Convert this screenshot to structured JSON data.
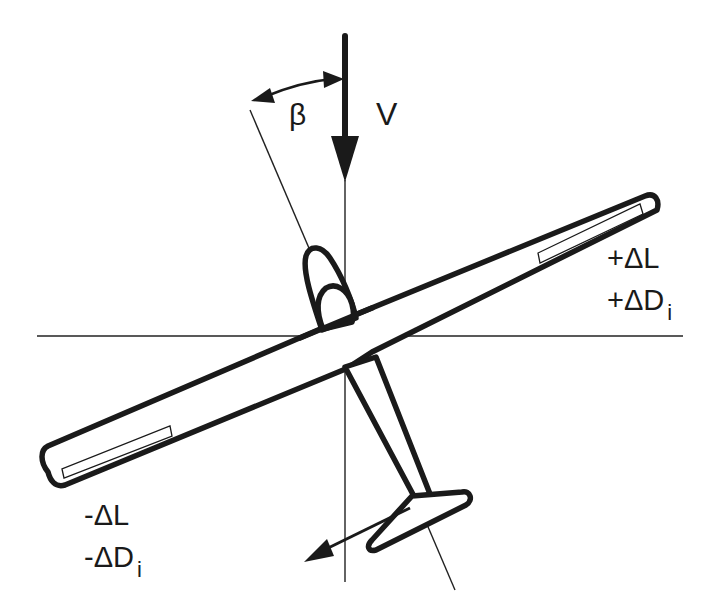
{
  "diagram": {
    "labels": {
      "velocity": "V",
      "sideslip_angle": "β",
      "right_wing_lift": "+ΔL",
      "right_wing_drag_prefix": "+ΔD",
      "right_wing_drag_sub": "i",
      "left_wing_lift": "-ΔL",
      "left_wing_drag_prefix": "-ΔD",
      "left_wing_drag_sub": "i"
    },
    "elements": [
      "horizontal reference axis",
      "vertical reference axis",
      "velocity arrow V pointing down",
      "fuselage axis line (tilted)",
      "sideslip angle arc β",
      "glider planform (wings, fuselage, canopy, tail)",
      "ailerons on both wingtips",
      "yawing moment arrow at tail"
    ],
    "colors": {
      "ink": "#1a1a1a",
      "background": "#ffffff"
    }
  }
}
